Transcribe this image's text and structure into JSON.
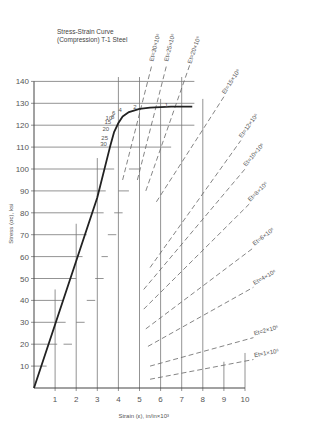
{
  "chart_data": {
    "type": "line",
    "title": "Stress-Strain Curve",
    "subtitle": "(Compression) T-1 Steel",
    "xlabel": "Strain (ε), in/in×10³",
    "ylabel": "Stress (σc), ksi",
    "xlim": [
      0,
      10
    ],
    "ylim": [
      0,
      140
    ],
    "x_ticks": [
      1,
      2,
      3,
      4,
      5,
      6,
      7,
      8,
      9,
      10
    ],
    "y_ticks": [
      10,
      20,
      30,
      40,
      50,
      60,
      70,
      80,
      90,
      100,
      110,
      120,
      130,
      140
    ],
    "grid": true,
    "series": [
      {
        "name": "Stress-strain curve",
        "style": "solid-thick",
        "x": [
          0,
          1,
          2,
          3,
          3.6,
          3.8,
          4.0,
          4.2,
          4.5,
          5.0,
          5.5,
          6.5,
          7.5
        ],
        "y": [
          0,
          29,
          58,
          87,
          110,
          117,
          121,
          124,
          126,
          127.5,
          128,
          128.5,
          128.5
        ]
      }
    ],
    "curve_point_labels": [
      {
        "label": "30",
        "x": 3.6,
        "y": 110
      },
      {
        "label": "25",
        "x": 3.65,
        "y": 113
      },
      {
        "label": "20",
        "x": 3.7,
        "y": 117
      },
      {
        "label": "15",
        "x": 3.8,
        "y": 120
      },
      {
        "label": "10",
        "x": 3.85,
        "y": 122
      },
      {
        "label": "8",
        "x": 3.95,
        "y": 122.5
      },
      {
        "label": "6",
        "x": 4.0,
        "y": 124
      },
      {
        "label": "4",
        "x": 4.3,
        "y": 125.5
      },
      {
        "label": "2",
        "x": 5.0,
        "y": 127
      },
      {
        "label": "1",
        "x": 6.5,
        "y": 128
      }
    ],
    "tangent_modulus_lines": [
      {
        "label": "Et=30×10⁶",
        "style": "dashed"
      },
      {
        "label": "Et=25×10⁶",
        "style": "dashed"
      },
      {
        "label": "Et=20×10⁶",
        "style": "dashed"
      },
      {
        "label": "Et=15×10⁶",
        "style": "dashed"
      },
      {
        "label": "Et=12×10⁶",
        "style": "dashed"
      },
      {
        "label": "Et=10×10⁶",
        "style": "dashed"
      },
      {
        "label": "Et=8×10⁶",
        "style": "dashed"
      },
      {
        "label": "Et=6×10⁶",
        "style": "dashed"
      },
      {
        "label": "Et=4×10⁶",
        "style": "dashed"
      },
      {
        "label": "Et=2×10⁶",
        "style": "dashed"
      },
      {
        "label": "Et=1×10⁶",
        "style": "dashed"
      }
    ]
  },
  "labels": {
    "title_line1": "Stress-Strain Curve",
    "title_line2": "(Compression) T-1 Steel",
    "xlabel": "Strain (ε), in/in×10³",
    "ylabel": "Stress (σc), ksi"
  }
}
